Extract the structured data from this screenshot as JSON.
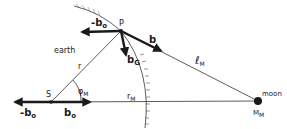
{
  "diagram": {
    "type": "force-vector diagram",
    "points": {
      "P": {
        "label": "P"
      },
      "S": {
        "label": "S"
      },
      "moon": {
        "label": "moon",
        "mass_label": "M",
        "mass_sub": "M"
      }
    },
    "regions": {
      "earth": {
        "label": "earth"
      }
    },
    "vectors": {
      "neg_b0_top": {
        "label": "-b",
        "sub": "o"
      },
      "b": {
        "label": "b"
      },
      "bG": {
        "label": "b",
        "sub": "G"
      },
      "neg_b0_bottom": {
        "label": "-b",
        "sub": "o"
      },
      "b0": {
        "label": "b",
        "sub": "o"
      }
    },
    "distances": {
      "r": {
        "label": "r"
      },
      "rM": {
        "label": "r",
        "sub": "M"
      },
      "lM": {
        "label": "ℓ",
        "sub": "M"
      }
    },
    "angles": {
      "phiM": {
        "label": "φ",
        "sub": "M"
      }
    },
    "colors": {
      "ink": "#1a1a1a",
      "background": "#ffffff"
    }
  }
}
